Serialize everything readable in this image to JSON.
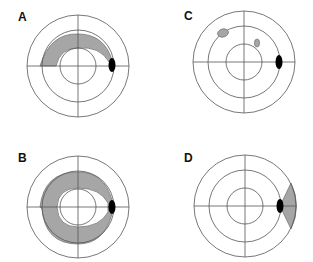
{
  "panels": [
    {
      "id": "A",
      "label": "A",
      "cx": 78,
      "cy": 66,
      "lx": 15,
      "ly": 10
    },
    {
      "id": "C",
      "label": "C",
      "cx": 244,
      "cy": 62,
      "lx": 183,
      "ly": 9
    },
    {
      "id": "B",
      "label": "B",
      "cx": 78,
      "cy": 207,
      "lx": 15,
      "ly": 151
    },
    {
      "id": "D",
      "label": "D",
      "cx": 245,
      "cy": 206,
      "lx": 183,
      "ly": 151
    }
  ],
  "colors": {
    "line": "#555555",
    "shade": "#a6a6a6",
    "spot": "#000000"
  }
}
